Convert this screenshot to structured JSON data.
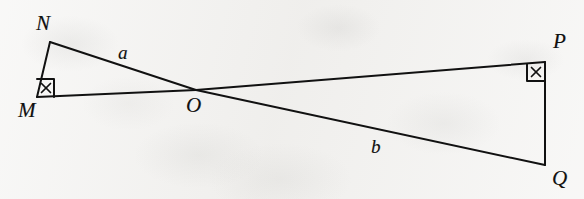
{
  "figure": {
    "kind": "plane-geometry-diagram",
    "canvas": {
      "width": 584,
      "height": 199
    },
    "background_color": "#f1f0ee",
    "ink_color": "#111111"
  },
  "vertices": [
    {
      "id": "N",
      "label": "N",
      "x": 50,
      "y": 42,
      "label_x": 36,
      "label_y": 13
    },
    {
      "id": "M",
      "label": "M",
      "x": 37,
      "y": 97,
      "label_x": 18,
      "label_y": 100
    },
    {
      "id": "O",
      "label": "O",
      "x": 196,
      "y": 90,
      "label_x": 186,
      "label_y": 95
    },
    {
      "id": "P",
      "label": "P",
      "x": 545,
      "y": 62,
      "label_x": 553,
      "label_y": 31
    },
    {
      "id": "Q",
      "label": "Q",
      "x": 545,
      "y": 165,
      "label_x": 552,
      "label_y": 168
    }
  ],
  "segments": [
    {
      "id": "MN",
      "from": "M",
      "to": "N",
      "x1": 37,
      "y1": 97,
      "x2": 50,
      "y2": 42
    },
    {
      "id": "NO",
      "from": "N",
      "to": "O",
      "x1": 50,
      "y1": 42,
      "x2": 196,
      "y2": 90
    },
    {
      "id": "OQ",
      "from": "O",
      "to": "Q",
      "x1": 196,
      "y1": 90,
      "x2": 545,
      "y2": 165
    },
    {
      "id": "MO",
      "from": "M",
      "to": "O",
      "x1": 37,
      "y1": 97,
      "x2": 196,
      "y2": 90
    },
    {
      "id": "OP",
      "from": "O",
      "to": "P",
      "x1": 196,
      "y1": 90,
      "x2": 545,
      "y2": 62
    },
    {
      "id": "PQ",
      "from": "P",
      "to": "Q",
      "x1": 545,
      "y1": 62,
      "x2": 545,
      "y2": 165
    }
  ],
  "side_labels": [
    {
      "id": "a",
      "label": "a",
      "on_segment": "NO",
      "x": 118,
      "y": 43
    },
    {
      "id": "b",
      "label": "b",
      "on_segment": "OQ",
      "x": 371,
      "y": 137
    }
  ],
  "angle_marks": [
    {
      "id": "angle-M",
      "at_vertex": "M",
      "type": "right-angle-with-x",
      "note": "right angle square marked with a small x",
      "square_path": "M 37 79 L 54 79 L 54 97",
      "x_center_x": 46,
      "x_center_y": 88,
      "x_size": 4.5
    },
    {
      "id": "angle-P",
      "at_vertex": "P",
      "type": "right-angle-with-x",
      "note": "right angle square marked with a small x",
      "square_path": "M 527 64 L 527 81 L 545 81",
      "x_center_x": 536,
      "x_center_y": 72,
      "x_size": 4.5
    }
  ],
  "stroke": {
    "width": 2.0,
    "linecap": "round",
    "linejoin": "round"
  }
}
